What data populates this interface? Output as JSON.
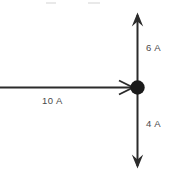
{
  "figure": {
    "canvas": {
      "width": 182,
      "height": 179,
      "background": "#ffffff"
    },
    "stroke_color": "#2b2b2b",
    "text_color": "#4a4a4a",
    "node": {
      "label": "junction-node",
      "center_x": 137.5,
      "center_y": 87.5,
      "radius": 7,
      "fill": "#1a1a1a"
    },
    "branches": [
      {
        "id": "incoming-horizontal",
        "label": "10 A",
        "value": 10,
        "unit": "A",
        "direction": "right",
        "orientation": "horizontal",
        "arrow": "inward-to-node",
        "label_x": 42,
        "label_y": 96
      },
      {
        "id": "outgoing-up",
        "label": "6 A",
        "value": 6,
        "unit": "A",
        "direction": "up",
        "orientation": "vertical",
        "arrow": "outward-from-node",
        "label_x": 146,
        "label_y": 43
      },
      {
        "id": "outgoing-down",
        "label": "4 A",
        "value": 4,
        "unit": "A",
        "direction": "down",
        "orientation": "vertical",
        "arrow": "outward-from-node",
        "label_x": 146,
        "label_y": 119
      }
    ]
  }
}
